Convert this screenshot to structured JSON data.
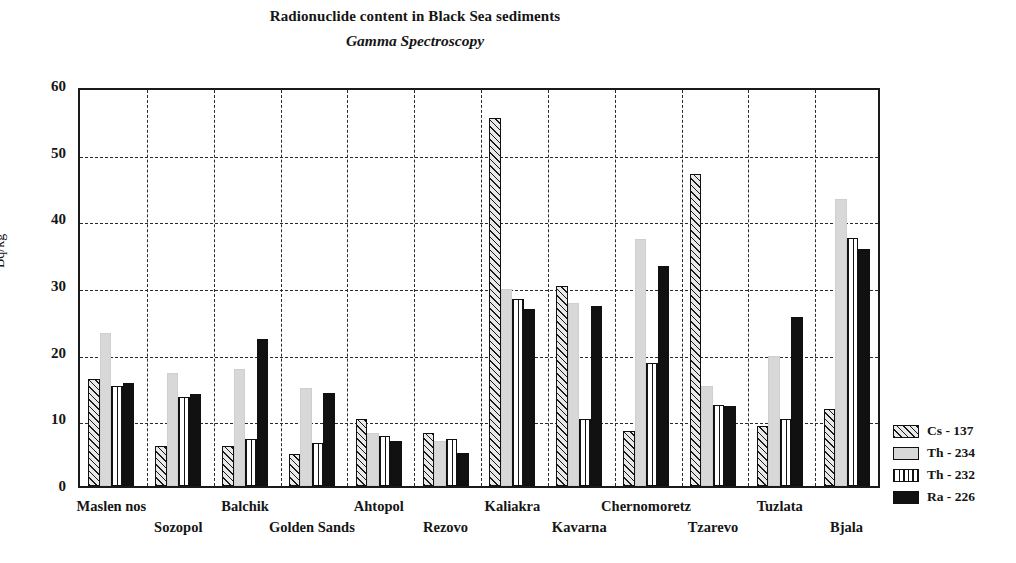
{
  "chart_data": {
    "type": "bar",
    "title": "Radionuclide content in Black Sea sediments",
    "subtitle": "Gamma Spectroscopy",
    "xlabel": "",
    "ylabel": "Bq/kg",
    "ylim": [
      0,
      60
    ],
    "yticks": [
      0,
      10,
      20,
      30,
      40,
      50,
      60
    ],
    "grid": "horizontal-and-vertical-dashed",
    "legend_position": "right",
    "categories": [
      "Maslen nos",
      "Sozopol",
      "Balchik",
      "Golden Sands",
      "Ahtopol",
      "Rezovo",
      "Kaliakra",
      "Kavarna",
      "Chernomoretz",
      "Tzarevo",
      "Tuzlata",
      "Bjala"
    ],
    "series": [
      {
        "name": "Cs - 137",
        "pattern": "diagonal-hatch",
        "color": "#e9e9e9",
        "values": [
          16.0,
          6.0,
          6.0,
          4.8,
          10.0,
          8.0,
          55.2,
          30.0,
          8.3,
          46.8,
          9.0,
          11.5
        ]
      },
      {
        "name": "Th - 234",
        "pattern": "light-gray-fill",
        "color": "#d8d8d8",
        "values": [
          23.0,
          17.0,
          17.5,
          14.7,
          8.0,
          6.8,
          29.5,
          27.5,
          37.0,
          15.0,
          19.5,
          43.0
        ]
      },
      {
        "name": "Th - 232",
        "pattern": "vertical-lines",
        "color": "#ffffff",
        "values": [
          15.0,
          13.4,
          7.0,
          6.5,
          7.5,
          7.0,
          28.0,
          10.0,
          18.5,
          12.2,
          10.0,
          37.2
        ]
      },
      {
        "name": "Ra - 226",
        "pattern": "solid-black",
        "color": "#111111",
        "values": [
          15.5,
          13.8,
          22.0,
          14.0,
          6.7,
          5.0,
          26.5,
          27.0,
          33.0,
          12.0,
          25.3,
          35.5
        ]
      }
    ]
  },
  "legend": {
    "items": [
      {
        "label": "Cs - 137"
      },
      {
        "label": "Th - 234"
      },
      {
        "label": "Th - 232"
      },
      {
        "label": "Ra - 226"
      }
    ]
  }
}
